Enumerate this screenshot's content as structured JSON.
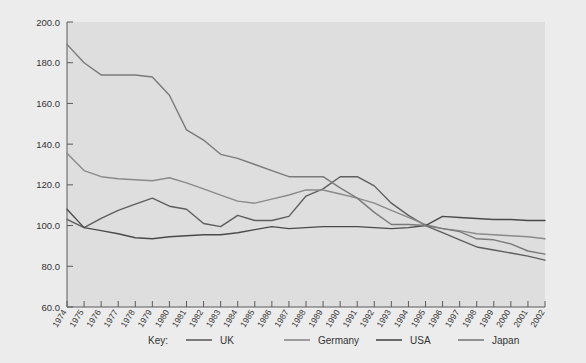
{
  "chart_data": {
    "type": "line",
    "title": "",
    "xlabel": "",
    "ylabel": "",
    "ylim": [
      60.0,
      200.0
    ],
    "ytick_labels": [
      "200.0",
      "180.0",
      "160.0",
      "140.0",
      "120.0",
      "100.0",
      "80.0",
      "60.0"
    ],
    "ytick_values": [
      200.0,
      180.0,
      160.0,
      140.0,
      120.0,
      100.0,
      80.0,
      60.0
    ],
    "grid": false,
    "legend_position": "bottom",
    "legend_title": "Key:",
    "categories": [
      "1974",
      "1975",
      "1976",
      "1977",
      "1978",
      "1979",
      "1980",
      "1981",
      "1982",
      "1983",
      "1984",
      "1985",
      "1986",
      "1987",
      "1988",
      "1989",
      "1990",
      "1991",
      "1992",
      "1993",
      "1994",
      "1995",
      "1996",
      "1997",
      "1998",
      "1999",
      "2000",
      "2001",
      "2002"
    ],
    "series": [
      {
        "name": "UK",
        "color": "#5e5e5e",
        "values": [
          103.0,
          99.0,
          103.5,
          107.5,
          110.5,
          113.5,
          109.5,
          108.0,
          101.0,
          99.5,
          105.0,
          102.5,
          102.5,
          104.5,
          114.5,
          118.0,
          124.0,
          124.0,
          119.5,
          111.0,
          105.0,
          100.0,
          96.5,
          93.0,
          89.5,
          88.0,
          86.5,
          85.0,
          83.0
        ]
      },
      {
        "name": "Germany",
        "color": "#8a8a8a",
        "values": [
          135.5,
          127.0,
          124.0,
          123.0,
          122.5,
          122.0,
          123.5,
          121.0,
          118.0,
          115.0,
          112.0,
          111.0,
          113.0,
          115.0,
          117.5,
          117.5,
          115.5,
          113.5,
          111.0,
          107.5,
          104.0,
          100.5,
          98.5,
          97.5,
          96.0,
          95.5,
          95.0,
          94.5,
          93.5
        ]
      },
      {
        "name": "USA",
        "color": "#4a4a4a",
        "values": [
          108.0,
          99.0,
          97.5,
          96.0,
          94.0,
          93.5,
          94.5,
          95.0,
          95.5,
          95.5,
          96.5,
          98.0,
          99.5,
          98.5,
          99.0,
          99.5,
          99.5,
          99.5,
          99.0,
          98.5,
          99.0,
          100.0,
          104.5,
          104.0,
          103.5,
          103.0,
          103.0,
          102.5,
          102.5
        ]
      },
      {
        "name": "Japan",
        "color": "#7a7a7a",
        "values": [
          189.0,
          180.0,
          174.0,
          174.0,
          174.0,
          173.0,
          164.0,
          147.0,
          142.0,
          135.0,
          133.0,
          130.0,
          127.0,
          124.0,
          124.0,
          124.0,
          118.5,
          113.5,
          106.5,
          100.5,
          100.5,
          100.0,
          98.5,
          97.0,
          93.5,
          93.0,
          91.0,
          87.5,
          86.0
        ]
      }
    ]
  },
  "legend": {
    "key_label": "Key:",
    "entries": [
      {
        "label": "UK"
      },
      {
        "label": "Germany"
      },
      {
        "label": "USA"
      },
      {
        "label": "Japan"
      }
    ]
  },
  "colors": {
    "page_background": "#ececec",
    "plot_background": "#dedede",
    "axis": "#5a5a5a",
    "text": "#333333"
  }
}
